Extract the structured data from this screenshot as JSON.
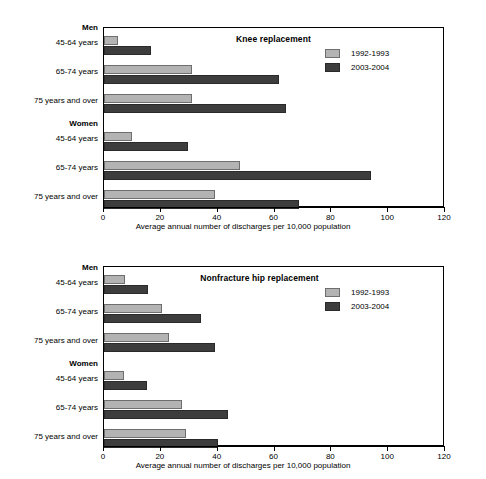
{
  "chart_data": [
    {
      "type": "bar",
      "orientation": "horizontal",
      "title": "Knee replacement",
      "xlabel": "Average annual number of discharges per 10,000 population",
      "ylabel": "",
      "xlim": [
        0,
        120
      ],
      "xticks": [
        0,
        20,
        40,
        60,
        80,
        100,
        120
      ],
      "grid": false,
      "legend_position": "top-right",
      "group_headers": [
        "Men",
        "Women"
      ],
      "categories": [
        "45-64 years",
        "65-74 years",
        "75 years and over",
        "45-64 years",
        "65-74 years",
        "75 years and over"
      ],
      "series": [
        {
          "name": "1992-1993",
          "color": "#b3b3b3",
          "values": [
            5,
            31,
            31,
            10,
            48,
            39
          ]
        },
        {
          "name": "2003-2004",
          "color": "#3d3d3d",
          "values": [
            16.5,
            61.5,
            64,
            29.5,
            94,
            68.5
          ]
        }
      ]
    },
    {
      "type": "bar",
      "orientation": "horizontal",
      "title": "Nonfracture hip replacement",
      "xlabel": "Average annual number of discharges per 10,000 population",
      "ylabel": "",
      "xlim": [
        0,
        120
      ],
      "xticks": [
        0,
        20,
        40,
        60,
        80,
        100,
        120
      ],
      "grid": false,
      "legend_position": "top-right",
      "group_headers": [
        "Men",
        "Women"
      ],
      "categories": [
        "45-64 years",
        "65-74 years",
        "75 years and over",
        "45-64 years",
        "65-74 years",
        "75 years and over"
      ],
      "series": [
        {
          "name": "1992-1993",
          "color": "#b3b3b3",
          "values": [
            7.5,
            20.5,
            23,
            7,
            27.5,
            29
          ]
        },
        {
          "name": "2003-2004",
          "color": "#3d3d3d",
          "values": [
            15.5,
            34,
            39,
            15,
            43.5,
            40
          ]
        }
      ]
    }
  ],
  "panels": [
    {
      "title": "Knee replacement",
      "xlabel": "Average annual number of discharges per 10,000 population",
      "xticks": [
        "0",
        "20",
        "40",
        "60",
        "80",
        "100",
        "120"
      ],
      "legend": [
        {
          "label": "1992-1993",
          "color": "#b3b3b3"
        },
        {
          "label": "2003-2004",
          "color": "#3d3d3d"
        }
      ],
      "ylabels": [
        {
          "text": "Men",
          "bold": true
        },
        {
          "text": "45-64 years",
          "bold": false
        },
        {
          "text": "65-74 years",
          "bold": false
        },
        {
          "text": "75 years and over",
          "bold": false
        },
        {
          "text": "Women",
          "bold": true
        },
        {
          "text": "45-64 years",
          "bold": false
        },
        {
          "text": "65-74 years",
          "bold": false
        },
        {
          "text": "75 years and over",
          "bold": false
        }
      ]
    },
    {
      "title": "Nonfracture hip replacement",
      "xlabel": "Average annual number of discharges per 10,000 population",
      "xticks": [
        "0",
        "20",
        "40",
        "60",
        "80",
        "100",
        "120"
      ],
      "legend": [
        {
          "label": "1992-1993",
          "color": "#b3b3b3"
        },
        {
          "label": "2003-2004",
          "color": "#3d3d3d"
        }
      ],
      "ylabels": [
        {
          "text": "Men",
          "bold": true
        },
        {
          "text": "45-64 years",
          "bold": false
        },
        {
          "text": "65-74 years",
          "bold": false
        },
        {
          "text": "75 years and over",
          "bold": false
        },
        {
          "text": "Women",
          "bold": true
        },
        {
          "text": "45-64 years",
          "bold": false
        },
        {
          "text": "65-74 years",
          "bold": false
        },
        {
          "text": "75 years and over",
          "bold": false
        }
      ]
    }
  ]
}
